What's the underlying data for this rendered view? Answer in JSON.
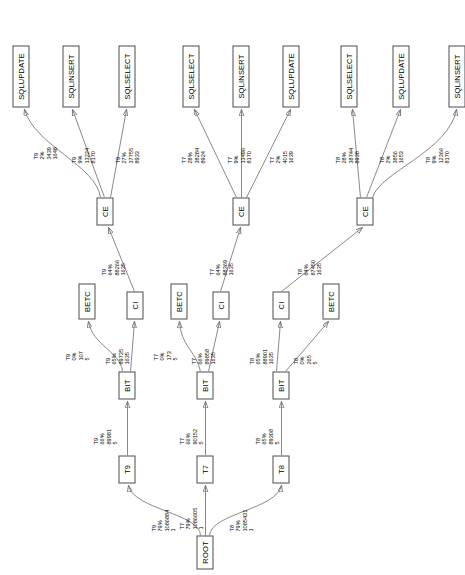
{
  "diagram": {
    "orientation": "rotated-90",
    "nodes": [
      {
        "id": "ROOT",
        "label": "ROOT",
        "x": 6,
        "y": 196,
        "w": 34,
        "h": 17
      },
      {
        "id": "T9",
        "label": "T9",
        "x": 92,
        "y": 118,
        "w": 28,
        "h": 17
      },
      {
        "id": "T7",
        "label": "T7",
        "x": 92,
        "y": 196,
        "w": 28,
        "h": 17
      },
      {
        "id": "T8",
        "label": "T8",
        "x": 92,
        "y": 272,
        "w": 28,
        "h": 17
      },
      {
        "id": "BIT9",
        "label": "BIT",
        "x": 176,
        "y": 118,
        "w": 28,
        "h": 17
      },
      {
        "id": "BIT7",
        "label": "BIT",
        "x": 176,
        "y": 196,
        "w": 28,
        "h": 17
      },
      {
        "id": "BIT8",
        "label": "BIT",
        "x": 176,
        "y": 272,
        "w": 28,
        "h": 17
      },
      {
        "id": "BETC9",
        "label": "BETC",
        "x": 256,
        "y": 78,
        "w": 36,
        "h": 17
      },
      {
        "id": "CI9",
        "label": "CI",
        "x": 256,
        "y": 126,
        "w": 28,
        "h": 17
      },
      {
        "id": "BETC7",
        "label": "BETC",
        "x": 256,
        "y": 170,
        "w": 36,
        "h": 17
      },
      {
        "id": "CI7",
        "label": "CI",
        "x": 256,
        "y": 212,
        "w": 28,
        "h": 17
      },
      {
        "id": "CI8",
        "label": "CI",
        "x": 256,
        "y": 272,
        "w": 28,
        "h": 17
      },
      {
        "id": "BETC8",
        "label": "BETC",
        "x": 256,
        "y": 322,
        "w": 36,
        "h": 17
      },
      {
        "id": "CE9",
        "label": "CE",
        "x": 350,
        "y": 96,
        "w": 28,
        "h": 17
      },
      {
        "id": "CE7",
        "label": "CE",
        "x": 350,
        "y": 232,
        "w": 28,
        "h": 17
      },
      {
        "id": "CE8",
        "label": "CE",
        "x": 350,
        "y": 356,
        "w": 28,
        "h": 17
      },
      {
        "id": "SQLUPDATE9",
        "label": "SQLUPDATE",
        "x": 468,
        "y": 12,
        "w": 62,
        "h": 17
      },
      {
        "id": "SQLINSERT9",
        "label": "SQLINSERT",
        "x": 468,
        "y": 62,
        "w": 62,
        "h": 17
      },
      {
        "id": "SQLSELECT9",
        "label": "SQLSELECT",
        "x": 468,
        "y": 118,
        "w": 62,
        "h": 17
      },
      {
        "id": "SQLSELECT7",
        "label": "SQLSELECT",
        "x": 468,
        "y": 182,
        "w": 62,
        "h": 17
      },
      {
        "id": "SQLINSERT7",
        "label": "SQLINSERT",
        "x": 468,
        "y": 232,
        "w": 62,
        "h": 17
      },
      {
        "id": "SQLUPDATE7",
        "label": "SQLUPDATE",
        "x": 468,
        "y": 282,
        "w": 62,
        "h": 17
      },
      {
        "id": "SQLSELECT8",
        "label": "SQLSELECT",
        "x": 468,
        "y": 340,
        "w": 62,
        "h": 17
      },
      {
        "id": "SQLUPDATE8",
        "label": "SQLUPDATE",
        "x": 468,
        "y": 392,
        "w": 62,
        "h": 17
      },
      {
        "id": "SQLINSERT8",
        "label": "SQLINSERT",
        "x": 468,
        "y": 448,
        "w": 62,
        "h": 17
      }
    ],
    "edges": [
      {
        "id": "e1",
        "from": "ROOT",
        "to": "T9",
        "lines": [
          "T9",
          "79%",
          "1086884",
          "1"
        ],
        "lx": 44,
        "ly": 150
      },
      {
        "id": "e2",
        "from": "ROOT",
        "to": "T7",
        "lines": [
          "T7",
          "79%",
          "1086605",
          "1"
        ],
        "lx": 46,
        "ly": 178
      },
      {
        "id": "e3",
        "from": "ROOT",
        "to": "T8",
        "lines": [
          "T8",
          "79%",
          "1085431",
          "1"
        ],
        "lx": 44,
        "ly": 228
      },
      {
        "id": "e4",
        "from": "T9",
        "to": "BIT9",
        "lines": [
          "T9",
          "66%",
          "89981",
          "5"
        ],
        "lx": 131,
        "ly": 92
      },
      {
        "id": "e5",
        "from": "T7",
        "to": "BIT7",
        "lines": [
          "T7",
          "66%",
          "90152",
          "5"
        ],
        "lx": 131,
        "ly": 178
      },
      {
        "id": "e6",
        "from": "T8",
        "to": "BIT8",
        "lines": [
          "T8",
          "65%",
          "89308",
          "5"
        ],
        "lx": 131,
        "ly": 254
      },
      {
        "id": "e7",
        "from": "BIT9",
        "to": "BETC9",
        "lines": [
          "T9",
          "0%",
          "107",
          "5"
        ],
        "lx": 215,
        "ly": 64
      },
      {
        "id": "e8",
        "from": "BIT9",
        "to": "CI9",
        "lines": [
          "T9",
          "65%",
          "89735",
          "1635"
        ],
        "lx": 211,
        "ly": 104
      },
      {
        "id": "e9",
        "from": "BIT7",
        "to": "BETC7",
        "lines": [
          "T7",
          "0%",
          "173",
          "5"
        ],
        "lx": 215,
        "ly": 152
      },
      {
        "id": "e10",
        "from": "BIT7",
        "to": "CI7",
        "lines": [
          "T7",
          "66%",
          "89858",
          "1635"
        ],
        "lx": 211,
        "ly": 190
      },
      {
        "id": "e11",
        "from": "BIT8",
        "to": "CI8",
        "lines": [
          "T8",
          "65%",
          "88901",
          "1635"
        ],
        "lx": 211,
        "ly": 248
      },
      {
        "id": "e12",
        "from": "BIT8",
        "to": "BETC8",
        "lines": [
          "T8",
          "0%",
          "265",
          "5"
        ],
        "lx": 211,
        "ly": 292
      },
      {
        "id": "e13",
        "from": "CI9",
        "to": "CE9",
        "lines": [
          "T9",
          "64%",
          "88266",
          "1635"
        ],
        "lx": 300,
        "ly": 100
      },
      {
        "id": "e14",
        "from": "CI7",
        "to": "CE7",
        "lines": [
          "T7",
          "64%",
          "88369",
          "1635"
        ],
        "lx": 300,
        "ly": 208
      },
      {
        "id": "e15",
        "from": "CI8",
        "to": "CE8",
        "lines": [
          "T8",
          "64%",
          "87450",
          "1635"
        ],
        "lx": 300,
        "ly": 296
      },
      {
        "id": "e16",
        "from": "CE9",
        "to": "SQLUPDATE9",
        "lines": [
          "T9",
          "2%",
          "3439",
          "1648"
        ],
        "lx": 416,
        "ly": 32
      },
      {
        "id": "e17",
        "from": "CE9",
        "to": "SQLINSERT9",
        "lines": [
          "T9",
          "9%",
          "13224",
          "8170"
        ],
        "lx": 412,
        "ly": 70
      },
      {
        "id": "e18",
        "from": "CE9",
        "to": "SQLSELECT9",
        "lines": [
          "T9",
          "27%",
          "37755",
          "8933"
        ],
        "lx": 412,
        "ly": 114
      },
      {
        "id": "e19",
        "from": "CE7",
        "to": "SQLSELECT7",
        "lines": [
          "T7",
          "28%",
          "38284",
          "8924"
        ],
        "lx": 412,
        "ly": 180
      },
      {
        "id": "e20",
        "from": "CE7",
        "to": "SQLINSERT7",
        "lines": [
          "T7",
          "9%",
          "13496",
          "8170"
        ],
        "lx": 412,
        "ly": 226
      },
      {
        "id": "e21",
        "from": "CE7",
        "to": "SQLUPDATE7",
        "lines": [
          "T7",
          "2%",
          "4015",
          "1639"
        ],
        "lx": 412,
        "ly": 268
      },
      {
        "id": "e22",
        "from": "CE8",
        "to": "SQLSELECT8",
        "lines": [
          "T8",
          "28%",
          "38744",
          "8938"
        ],
        "lx": 412,
        "ly": 334
      },
      {
        "id": "e23",
        "from": "CE8",
        "to": "SQLUPDATE8",
        "lines": [
          "T8",
          "2%",
          "3856",
          "1653"
        ],
        "lx": 412,
        "ly": 378
      },
      {
        "id": "e24",
        "from": "CE8",
        "to": "SQLINSERT8",
        "lines": [
          "T8",
          "9%",
          "12366",
          "8170"
        ],
        "lx": 412,
        "ly": 424
      }
    ],
    "sidenote": ""
  }
}
